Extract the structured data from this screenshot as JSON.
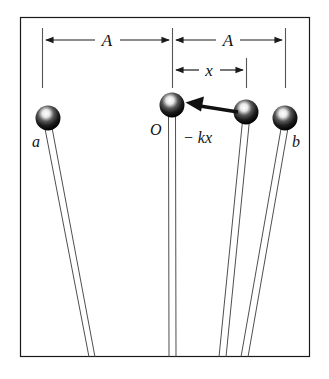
{
  "figure": {
    "frame": {
      "x": 20,
      "y": 17,
      "width": 290,
      "height": 340,
      "stroke_color": "#1a1a1a",
      "fill_color": "#ffffff"
    },
    "labels": {
      "amplitude_left": "A",
      "amplitude_right": "A",
      "displacement": "x",
      "bob_left": "a",
      "bob_center": "O",
      "bob_right": "b",
      "force": "− kx"
    },
    "dimensions": [
      {
        "name": "amplitude-left",
        "label": "A",
        "from_x": 42,
        "to_x": 172,
        "y": 40
      },
      {
        "name": "amplitude-right",
        "label": "A",
        "from_x": 172,
        "to_x": 285,
        "y": 40
      },
      {
        "name": "displacement",
        "label": "x",
        "from_x": 172,
        "to_x": 246,
        "y": 70
      }
    ],
    "tick_lines": [
      {
        "name": "tick-left",
        "x": 42,
        "y1": 28,
        "y2": 88
      },
      {
        "name": "tick-center",
        "x": 172,
        "y1": 28,
        "y2": 88
      },
      {
        "name": "tick-displacement",
        "x": 246,
        "y1": 58,
        "y2": 88
      },
      {
        "name": "tick-right",
        "x": 285,
        "y1": 28,
        "y2": 88
      }
    ],
    "bobs": [
      {
        "name": "bob-a",
        "label": "a",
        "cx": 48,
        "cy": 118,
        "r": 12,
        "label_x": 32,
        "label_y": 146,
        "pivot_x": 93
      },
      {
        "name": "bob-o",
        "label": "O",
        "cx": 172,
        "cy": 105,
        "r": 12,
        "label_x": 152,
        "label_y": 134,
        "pivot_x": 172
      },
      {
        "name": "bob-displaced",
        "label": "",
        "cx": 246,
        "cy": 112,
        "r": 12,
        "label_x": 0,
        "label_y": 0,
        "pivot_x": 222
      },
      {
        "name": "bob-b",
        "label": "b",
        "cx": 285,
        "cy": 118,
        "r": 12,
        "label_x": 293,
        "label_y": 146,
        "pivot_x": 245
      }
    ],
    "force_arrow": {
      "name": "restoring-force-arrow",
      "label": "− kx",
      "from_x": 238,
      "from_y": 110,
      "to_x": 186,
      "to_y": 102,
      "label_x": 184,
      "label_y": 142
    },
    "colors": {
      "ink": "#1a1a1a",
      "bob_fill": "#1b1b1b",
      "bob_highlight": "#f2f2f2",
      "string": "#3a3a3a",
      "paper": "#ffffff"
    }
  }
}
